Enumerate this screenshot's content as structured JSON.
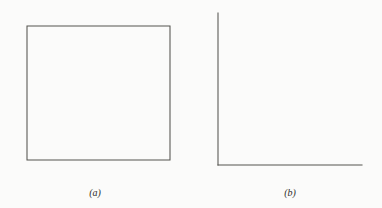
{
  "figure": {
    "background_color": "#fbfbfa",
    "ink_color": "#3a3936",
    "axis_color": "#55544f"
  },
  "panels": [
    {
      "id": "a",
      "caption": "(a)",
      "frame_style": "full-box",
      "marker_upper": "plus",
      "marker_lower": "cross"
    },
    {
      "id": "b",
      "caption": "(b)",
      "frame_style": "left-bottom",
      "marker_upper": "plus",
      "marker_lower": "circle-dot"
    }
  ],
  "chart_data": [
    {
      "type": "scatter",
      "title": "(a)",
      "xlabel": "",
      "ylabel": "",
      "xlim": [
        1.0,
        9.0
      ],
      "ylim": [
        5.45,
        8.45
      ],
      "xticks": [
        2,
        4,
        6,
        8
      ],
      "yticks": [
        6,
        7,
        8
      ],
      "xtick_labels": [
        "2",
        "4",
        "6",
        "8"
      ],
      "ytick_labels": [
        "6",
        "7",
        "8"
      ],
      "grid": false,
      "legend": "none",
      "frame": "box",
      "series": [
        {
          "name": "upper-plus",
          "marker": "plus",
          "x": [
            2.05,
            2.15,
            2.45,
            2.7,
            2.95,
            3.0,
            3.45,
            3.6,
            4.05,
            4.45,
            4.95,
            5.45,
            6.3,
            6.9
          ],
          "y": [
            7.88,
            7.86,
            7.75,
            7.68,
            7.62,
            7.56,
            7.66,
            7.52,
            7.47,
            7.4,
            7.2,
            7.12,
            6.88,
            6.62
          ],
          "fit_line": {
            "x0": 2.0,
            "y0": 8.0,
            "x1": 7.3,
            "y1": 6.48
          }
        },
        {
          "name": "lower-cross",
          "marker": "cross",
          "x": [
            2.55,
            2.7,
            2.85,
            3.0,
            3.3,
            3.55,
            4.2,
            4.5,
            4.9,
            5.35,
            5.6,
            6.25,
            6.5,
            6.85,
            7.35,
            7.6,
            7.95,
            8.25,
            8.45
          ],
          "y": [
            6.72,
            6.68,
            6.78,
            6.76,
            6.65,
            6.6,
            6.42,
            6.35,
            6.3,
            6.15,
            6.05,
            6.1,
            6.06,
            6.12,
            5.92,
            5.88,
            5.85,
            5.8,
            5.74
          ],
          "fit_line": {
            "x0": 2.35,
            "y0": 6.88,
            "x1": 8.55,
            "y1": 5.73
          }
        }
      ]
    },
    {
      "type": "scatter",
      "title": "(b)",
      "xlabel": "",
      "ylabel": "",
      "xlim": [
        4.85,
        12.6
      ],
      "ylim": [
        6.95,
        10.45
      ],
      "xticks": [
        6,
        8,
        10,
        12
      ],
      "yticks": [
        7,
        8,
        9,
        10
      ],
      "xtick_labels": [
        "6",
        "8",
        "10",
        "12"
      ],
      "ytick_labels": [
        "7",
        "8",
        "9",
        "10"
      ],
      "grid": false,
      "legend": "none",
      "frame": "left-bottom",
      "series": [
        {
          "name": "upper-plus",
          "marker": "plus",
          "x": [
            4.95,
            6.3,
            6.35,
            7.5,
            7.95,
            8.5,
            8.7,
            9.2,
            9.4,
            9.55,
            10.15,
            10.35,
            10.55,
            11.25,
            11.6,
            12.05,
            12.2
          ],
          "y": [
            10.22,
            9.92,
            9.6,
            9.58,
            9.15,
            9.0,
            8.88,
            8.85,
            8.95,
            8.65,
            8.7,
            8.62,
            8.65,
            8.18,
            8.05,
            8.02,
            8.0
          ],
          "fit_line": {
            "x0": 4.9,
            "y0": 10.32,
            "x1": 12.05,
            "y1": 7.9
          }
        },
        {
          "name": "lower-circledot",
          "marker": "circle-dot",
          "x": [
            5.3,
            6.1,
            6.45,
            7.3,
            7.55,
            8.05,
            9.2,
            9.85,
            10.15,
            10.25,
            10.7,
            11.25,
            11.6,
            11.7,
            12.25
          ],
          "y": [
            9.22,
            8.88,
            8.55,
            8.28,
            8.55,
            8.45,
            8.1,
            7.55,
            7.52,
            7.62,
            7.7,
            7.38,
            7.18,
            7.12,
            7.12
          ],
          "fit_line": {
            "x0": 5.05,
            "y0": 9.28,
            "x1": 12.45,
            "y1": 7.05
          }
        }
      ]
    }
  ]
}
